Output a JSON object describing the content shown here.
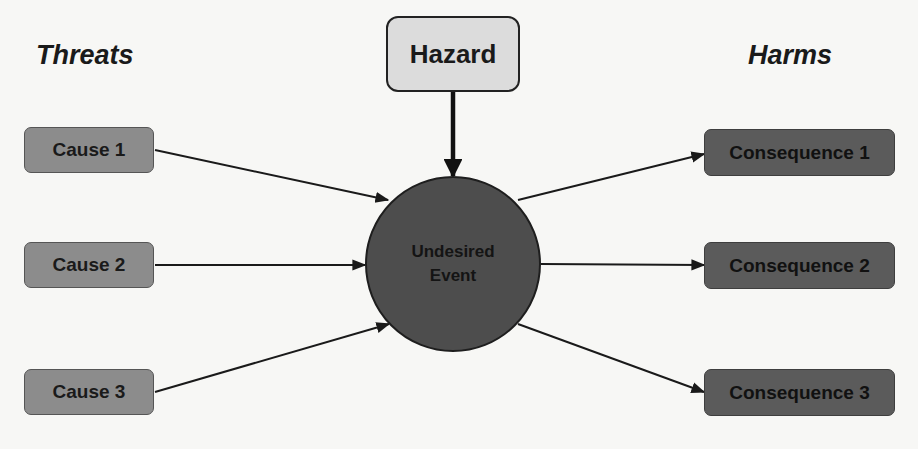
{
  "diagram": {
    "type": "bow-tie",
    "headings": {
      "left": "Threats",
      "right": "Harms"
    },
    "hazard": {
      "label": "Hazard"
    },
    "central_event": {
      "line1": "Undesired",
      "line2": "Event"
    },
    "causes": [
      {
        "label": "Cause 1"
      },
      {
        "label": "Cause 2"
      },
      {
        "label": "Cause 3"
      }
    ],
    "consequences": [
      {
        "label": "Consequence 1"
      },
      {
        "label": "Consequence 2"
      },
      {
        "label": "Consequence 3"
      }
    ],
    "colors": {
      "background": "#f7f7f5",
      "hazard_fill": "#dcdcdc",
      "cause_fill": "#8c8c8c",
      "event_fill": "#4d4d4d",
      "consequence_fill": "#5b5b5b",
      "arrow": "#1a1a1a"
    },
    "connections": [
      {
        "from": "Hazard",
        "to": "Undesired Event"
      },
      {
        "from": "Cause 1",
        "to": "Undesired Event"
      },
      {
        "from": "Cause 2",
        "to": "Undesired Event"
      },
      {
        "from": "Cause 3",
        "to": "Undesired Event"
      },
      {
        "from": "Undesired Event",
        "to": "Consequence 1"
      },
      {
        "from": "Undesired Event",
        "to": "Consequence 2"
      },
      {
        "from": "Undesired Event",
        "to": "Consequence 3"
      }
    ]
  }
}
